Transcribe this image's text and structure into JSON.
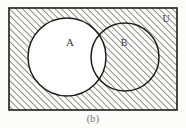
{
  "figure": {
    "type": "venn-diagram",
    "caption": "(b)",
    "universe_label": "U",
    "set_labels": {
      "a": "A",
      "b": "B"
    },
    "shaded_meaning": "A-complement",
    "colors": {
      "ink": "#1c1c1c",
      "hatch": "#2a2a2a",
      "paper": "#fdfdfb",
      "caption": "#6f6f6a"
    },
    "regions": [
      {
        "name": "outside-both-circles",
        "shaded": true
      },
      {
        "name": "inside-A-only",
        "shaded": false
      },
      {
        "name": "intersection-A-and-B",
        "shaded": false
      },
      {
        "name": "inside-B-only",
        "shaded": true
      }
    ],
    "geometry": {
      "rect": {
        "x": 9,
        "y": 8,
        "width": 168,
        "height": 102
      },
      "circle_a": {
        "cx": 67,
        "cy": 57,
        "r": 39
      },
      "circle_b": {
        "cx": 125,
        "cy": 57,
        "r": 34
      },
      "label_a": {
        "x": 70,
        "y": 45
      },
      "label_b": {
        "x": 124,
        "y": 45
      },
      "label_u": {
        "x": 166,
        "y": 20
      }
    },
    "hatch": {
      "angle_degrees": 45,
      "spacing_px": 4.6,
      "line_width_px": 1
    }
  }
}
